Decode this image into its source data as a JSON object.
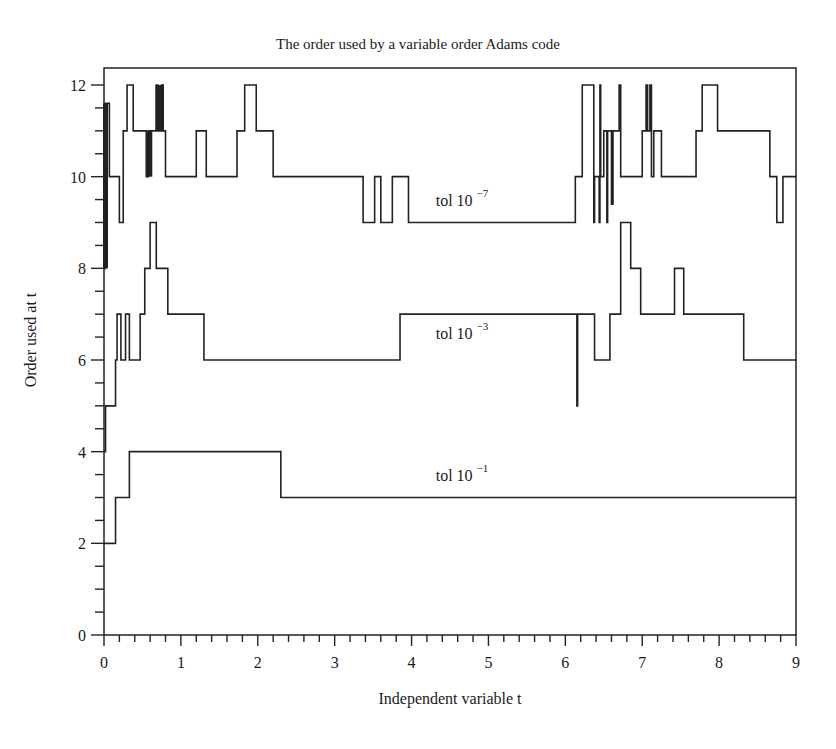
{
  "chart_data": {
    "type": "line",
    "step": true,
    "title": "The order used by a variable order Adams code",
    "xlabel": "Independent variable t",
    "ylabel": "Order used at t",
    "xlim": [
      0,
      9
    ],
    "ylim": [
      0,
      12
    ],
    "xticks": [
      0,
      1,
      2,
      3,
      4,
      5,
      6,
      7,
      8,
      9
    ],
    "xminor_step": 0.2,
    "yticks": [
      0,
      2,
      4,
      6,
      8,
      10,
      12
    ],
    "yminor_step": 0.5,
    "grid": false,
    "legend": "inline labels",
    "series": [
      {
        "name": "tol 10^-7",
        "label_base": "tol 10",
        "label_exp": "−7",
        "label_pos": {
          "t": 4.6,
          "y": 9.5
        },
        "steps": [
          [
            0.0,
            8
          ],
          [
            0.02,
            11.6
          ],
          [
            0.07,
            10
          ],
          [
            0.2,
            9
          ],
          [
            0.25,
            11
          ],
          [
            0.3,
            12
          ],
          [
            0.38,
            11
          ],
          [
            0.55,
            10
          ],
          [
            0.58,
            11
          ],
          [
            0.62,
            11
          ],
          [
            0.68,
            12
          ],
          [
            0.7,
            11
          ],
          [
            0.75,
            12
          ],
          [
            0.77,
            11
          ],
          [
            0.8,
            10
          ],
          [
            1.2,
            11
          ],
          [
            1.33,
            10
          ],
          [
            1.73,
            11
          ],
          [
            1.83,
            12
          ],
          [
            1.98,
            11
          ],
          [
            2.2,
            10
          ],
          [
            3.37,
            9
          ],
          [
            3.52,
            10
          ],
          [
            3.6,
            9
          ],
          [
            3.75,
            10
          ],
          [
            3.96,
            9
          ],
          [
            6.13,
            10
          ],
          [
            6.22,
            12
          ],
          [
            6.37,
            9
          ],
          [
            6.38,
            10
          ],
          [
            6.44,
            9
          ],
          [
            6.45,
            12
          ],
          [
            6.46,
            10
          ],
          [
            6.5,
            11
          ],
          [
            6.54,
            9
          ],
          [
            6.55,
            11
          ],
          [
            6.6,
            9.4
          ],
          [
            6.62,
            11
          ],
          [
            6.7,
            12
          ],
          [
            6.72,
            10
          ],
          [
            7.0,
            11
          ],
          [
            7.05,
            12
          ],
          [
            7.07,
            11
          ],
          [
            7.1,
            12
          ],
          [
            7.12,
            10
          ],
          [
            7.15,
            11
          ],
          [
            7.25,
            10
          ],
          [
            7.7,
            11
          ],
          [
            7.78,
            12
          ],
          [
            7.98,
            11
          ],
          [
            8.66,
            10
          ],
          [
            8.75,
            9
          ],
          [
            8.83,
            10
          ],
          [
            9.0,
            10
          ]
        ]
      },
      {
        "name": "tol 10^-3",
        "label_base": "tol 10",
        "label_exp": "−3",
        "label_pos": {
          "t": 4.6,
          "y": 6.6
        },
        "steps": [
          [
            0.0,
            4
          ],
          [
            0.02,
            5
          ],
          [
            0.15,
            6
          ],
          [
            0.17,
            7
          ],
          [
            0.22,
            6
          ],
          [
            0.28,
            7
          ],
          [
            0.33,
            6
          ],
          [
            0.47,
            7
          ],
          [
            0.53,
            8
          ],
          [
            0.6,
            9
          ],
          [
            0.68,
            8
          ],
          [
            0.83,
            7
          ],
          [
            1.3,
            6
          ],
          [
            3.85,
            7
          ],
          [
            6.15,
            5
          ],
          [
            6.16,
            7
          ],
          [
            6.38,
            6
          ],
          [
            6.58,
            7
          ],
          [
            6.72,
            9
          ],
          [
            6.85,
            8
          ],
          [
            6.98,
            7
          ],
          [
            7.42,
            8
          ],
          [
            7.54,
            7
          ],
          [
            8.32,
            6
          ],
          [
            9.0,
            6
          ]
        ]
      },
      {
        "name": "tol 10^-1",
        "label_base": "tol 10",
        "label_exp": "−1",
        "label_pos": {
          "t": 4.6,
          "y": 3.5
        },
        "steps": [
          [
            0.0,
            2
          ],
          [
            0.15,
            3
          ],
          [
            0.33,
            4
          ],
          [
            2.3,
            3
          ],
          [
            9.0,
            3
          ]
        ]
      }
    ]
  },
  "plot_area": {
    "left": 104,
    "right": 796,
    "y0_px": 635,
    "y12_px": 85,
    "top": 68
  }
}
